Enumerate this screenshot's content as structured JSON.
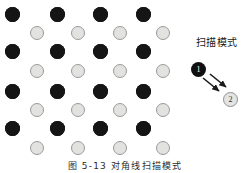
{
  "figure": {
    "caption": "图 5-13   对角线扫描模式",
    "scan_label": "扫描模式",
    "marker_one": "1",
    "marker_two": "2",
    "colors": {
      "dark_node": "#151515",
      "light_node_fill": "#e2e2e0",
      "light_node_border": "#9a9a98",
      "arrow": "#1a1a1a",
      "background": "#ffffff",
      "text": "#1a1a1a"
    },
    "lattice": {
      "dark_rows": [
        {
          "cy": 14,
          "cx": [
            12,
            57,
            100,
            143
          ]
        },
        {
          "cy": 51,
          "cx": [
            12,
            57,
            100,
            143
          ]
        },
        {
          "cy": 91,
          "cx": [
            12,
            57,
            100,
            143
          ]
        },
        {
          "cy": 128,
          "cx": [
            12,
            57,
            100,
            143
          ]
        }
      ],
      "light_rows": [
        {
          "cy": 33,
          "cx": [
            37,
            78,
            120,
            163
          ]
        },
        {
          "cy": 71,
          "cx": [
            37,
            78,
            120,
            163
          ]
        },
        {
          "cy": 110,
          "cx": [
            37,
            78,
            120,
            163
          ]
        },
        {
          "cy": 148,
          "cx": [
            37,
            78,
            120,
            163
          ]
        }
      ],
      "dark_diameter": 15,
      "light_diameter": 14
    },
    "arrows": [
      {
        "x1": 203,
        "y1": 78,
        "x2": 219,
        "y2": 91
      },
      {
        "x1": 210,
        "y1": 74,
        "x2": 226,
        "y2": 87
      }
    ]
  }
}
